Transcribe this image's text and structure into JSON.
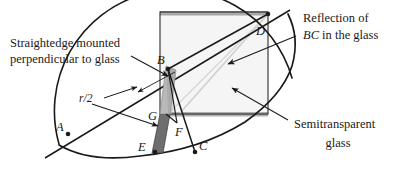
{
  "figure": {
    "background_color": "#ffffff",
    "ink_color": "#1a1a1a",
    "glass_fill_color": "#f4f4f4",
    "glass_edge_color": "#9a9a9a",
    "straightedge_upper_color": "#b5b5b5",
    "straightedge_lower_color": "#6e6e6e",
    "reflection_line_color": "#cfcfcf"
  },
  "callouts": {
    "straightedge": {
      "line1": "Straightedge mounted",
      "line2": "perpendicular to glass"
    },
    "reflection": {
      "line1": "Reflection of",
      "line2_italic": "BC",
      "line2_rest": " in the glass"
    },
    "glass": {
      "line1": "Semitransparent",
      "line2": "glass"
    },
    "radius": {
      "text": "r/2"
    }
  },
  "points": [
    {
      "name": "A",
      "label": "A",
      "x": 68,
      "y": 134,
      "label_x": 56,
      "label_y": 130,
      "marked": true
    },
    {
      "name": "B",
      "label": "B",
      "x": 168,
      "y": 69,
      "label_x": 160,
      "label_y": 62,
      "marked": true
    },
    {
      "name": "C",
      "label": "C",
      "x": 195,
      "y": 152,
      "label_x": 199,
      "label_y": 148,
      "marked": true
    },
    {
      "name": "D",
      "label": "D",
      "x": 268,
      "y": 14,
      "label_x": 258,
      "label_y": 33,
      "marked": true
    },
    {
      "name": "E",
      "label": "E",
      "x": 155,
      "y": 152,
      "label_x": 140,
      "label_y": 148,
      "marked": true
    },
    {
      "name": "F",
      "label": "F",
      "x": 177,
      "y": 123,
      "label_x": 176,
      "label_y": 133,
      "marked": false
    },
    {
      "name": "G",
      "label": "G",
      "x": 166,
      "y": 114,
      "label_x": 151,
      "label_y": 117,
      "marked": false
    }
  ],
  "geometry": {
    "glass_square": {
      "left": 160,
      "top": 12,
      "right": 268,
      "bottom": 114
    },
    "arc_center_x": 175,
    "arc_center_y": 77,
    "arc_radius": 118,
    "segments": [
      {
        "name": "BD",
        "from": "B",
        "to": "D"
      },
      {
        "name": "BC",
        "from": "B",
        "to": "C"
      },
      {
        "name": "EB-straightedge",
        "from": "E",
        "to": "B"
      },
      {
        "name": "GF",
        "from": "G",
        "to": "F"
      },
      {
        "name": "AB-ray",
        "from": "A",
        "to": "B"
      }
    ]
  }
}
